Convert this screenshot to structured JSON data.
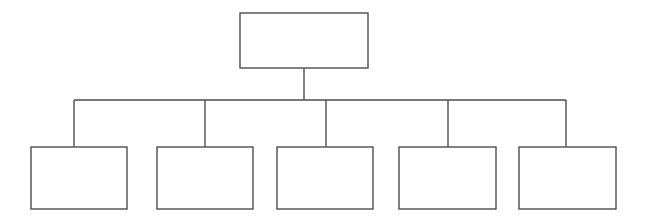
{
  "diagram": {
    "title": "",
    "type": "organizational-hierarchy",
    "orientation": "top-down",
    "background_color": "#ffffff",
    "line_color": "#4d4d4d",
    "box_fill_color": "#ffffff",
    "line_width": 1.4,
    "canvas": {
      "width": 645,
      "height": 219
    },
    "root": {
      "label": "",
      "x": 240,
      "y": 13,
      "width": 128,
      "height": 55
    },
    "bus": {
      "y": 100,
      "x_start": 74,
      "x_end": 566,
      "stem_x": 304,
      "stem_y_start": 68,
      "stem_y_end": 100
    },
    "children": [
      {
        "label": "",
        "x": 31,
        "y": 147,
        "width": 96,
        "height": 62,
        "drop_x": 74
      },
      {
        "label": "",
        "x": 157,
        "y": 147,
        "width": 96,
        "height": 62,
        "drop_x": 205
      },
      {
        "label": "",
        "x": 277,
        "y": 147,
        "width": 96,
        "height": 62,
        "drop_x": 326
      },
      {
        "label": "",
        "x": 399,
        "y": 147,
        "width": 97,
        "height": 62,
        "drop_x": 448
      },
      {
        "label": "",
        "x": 519,
        "y": 147,
        "width": 97,
        "height": 62,
        "drop_x": 566
      }
    ]
  }
}
